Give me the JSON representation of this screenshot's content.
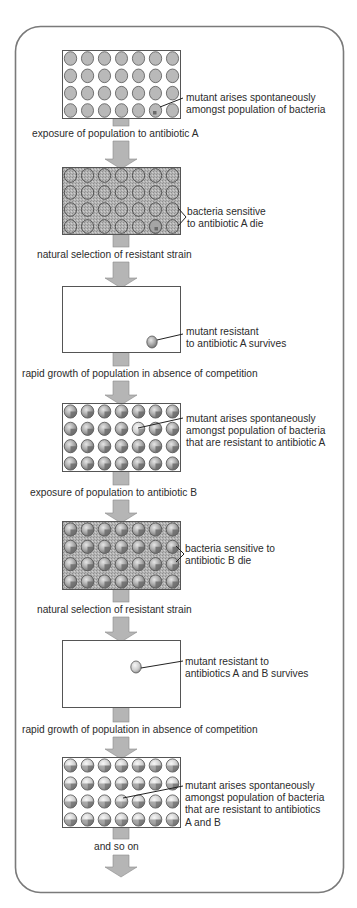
{
  "diagram": {
    "title": "",
    "frame": {
      "border_color": "#7a7a7a",
      "corner_radius": 25
    },
    "colors": {
      "arrow_fill": "#b5b5b5",
      "arrow_stroke": "#8a8a8a",
      "cell_fill": "#b9b9b9",
      "cell_stroke": "#555555",
      "antibiotic_background": "#a9a9a9",
      "box_stroke": "#555555",
      "text": "#2b2b2b"
    },
    "stages": [
      {
        "id": "stage-1",
        "type": "population",
        "background": "plain",
        "cell_style": "wild-type",
        "mutant_position": [
          3,
          5
        ],
        "annotation": [
          "mutant arises spontaneously",
          "amongst population of bacteria"
        ]
      },
      {
        "id": "stage-2",
        "type": "population",
        "background": "antibiotic",
        "cell_style": "dead-outline",
        "mutant_position": [
          3,
          5
        ],
        "annotation": [
          "bacteria sensitive",
          "to antibiotic A die"
        ]
      },
      {
        "id": "stage-3",
        "type": "survivor",
        "background": "plain",
        "annotation": [
          "mutant resistant",
          "to antibiotic A survives"
        ]
      },
      {
        "id": "stage-4",
        "type": "population",
        "background": "plain",
        "cell_style": "resistant-A",
        "mutant_position": [
          1,
          4
        ],
        "annotation": [
          "mutant arises spontaneously",
          "amongst population of bacteria",
          "that are resistant to antibiotic A"
        ]
      },
      {
        "id": "stage-5",
        "type": "population",
        "background": "antibiotic",
        "cell_style": "resistant-A",
        "annotation": [
          "bacteria sensitive to",
          "antibiotic B die"
        ]
      },
      {
        "id": "stage-6",
        "type": "survivor",
        "background": "plain",
        "annotation": [
          "mutant resistant to",
          "antibiotics A and B survives"
        ]
      },
      {
        "id": "stage-7",
        "type": "population",
        "background": "plain",
        "cell_style": "resistant-AB",
        "mutant_position": [
          2,
          3
        ],
        "annotation": [
          "mutant arises spontaneously",
          "amongst population of bacteria",
          "that are resistant to antibiotics",
          "A and B"
        ]
      }
    ],
    "transitions": [
      "exposure of population to antibiotic A",
      "natural selection of resistant strain",
      "rapid growth of population in absence of competition",
      "exposure of population to antibiotic B",
      "natural selection of resistant strain",
      "rapid growth of population in absence of competition",
      "and so on"
    ],
    "grid": {
      "rows": 4,
      "cols": 7
    }
  }
}
